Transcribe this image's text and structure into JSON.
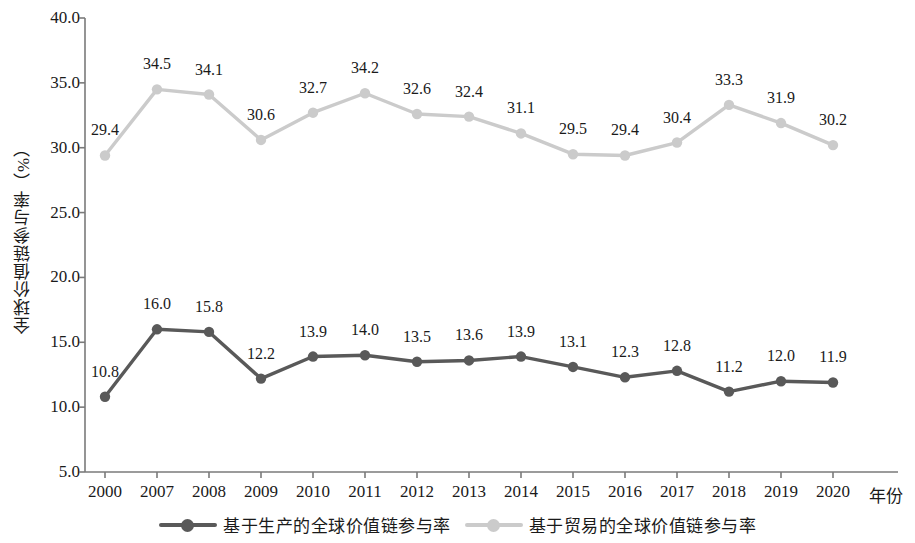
{
  "chart_data": {
    "type": "line",
    "title": "",
    "xlabel": "年份",
    "ylabel": "全球价值链参与率（%）",
    "categories": [
      "2000",
      "2007",
      "2008",
      "2009",
      "2010",
      "2011",
      "2012",
      "2013",
      "2014",
      "2015",
      "2016",
      "2017",
      "2018",
      "2019",
      "2020"
    ],
    "ylim": [
      5.0,
      40.0
    ],
    "yticks": [
      "5.0",
      "10.0",
      "15.0",
      "20.0",
      "25.0",
      "30.0",
      "35.0",
      "40.0"
    ],
    "ytick_values": [
      5.0,
      10.0,
      15.0,
      20.0,
      25.0,
      30.0,
      35.0,
      40.0
    ],
    "grid": false,
    "legend_position": "bottom",
    "series": [
      {
        "name": "基于生产的全球价值链参与率",
        "color": "#595959",
        "values": [
          10.8,
          16.0,
          15.8,
          12.2,
          13.9,
          14.0,
          13.5,
          13.6,
          13.9,
          13.1,
          12.3,
          12.8,
          11.2,
          12.0,
          11.9
        ],
        "labels": [
          "10.8",
          "16.0",
          "15.8",
          "12.2",
          "13.9",
          "14.0",
          "13.5",
          "13.6",
          "13.9",
          "13.1",
          "12.3",
          "12.8",
          "11.2",
          "12.0",
          "11.9"
        ]
      },
      {
        "name": "基于贸易的全球价值链参与率",
        "color": "#cbcbcb",
        "values": [
          29.4,
          34.5,
          34.1,
          30.6,
          32.7,
          34.2,
          32.6,
          32.4,
          31.1,
          29.5,
          29.4,
          30.4,
          33.3,
          31.9,
          30.2
        ],
        "labels": [
          "29.4",
          "34.5",
          "34.1",
          "30.6",
          "32.7",
          "34.2",
          "32.6",
          "32.4",
          "31.1",
          "29.5",
          "29.4",
          "30.4",
          "33.3",
          "31.9",
          "30.2"
        ]
      }
    ]
  },
  "axis": {
    "line_color": "#7a7a7a"
  }
}
